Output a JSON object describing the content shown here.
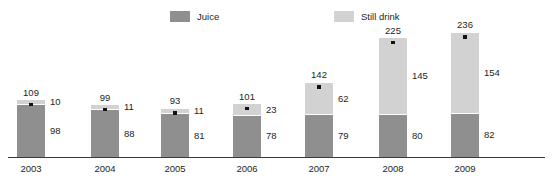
{
  "chart_data": {
    "type": "bar",
    "subtype": "stacked-bar",
    "title": "",
    "subtitle": "",
    "xlabel": "",
    "ylabel": "",
    "grid": false,
    "legend_position": "top-center",
    "ylim": [
      0,
      236
    ],
    "categories": [
      "2003",
      "2004",
      "2005",
      "2006",
      "2007",
      "2008",
      "2009"
    ],
    "series": [
      {
        "name": "Juice",
        "color": "#8f8f8f",
        "values": [
          98,
          88,
          81,
          78,
          79,
          80,
          82
        ]
      },
      {
        "name": "Still drink",
        "color": "#d2d2d2",
        "values": [
          10,
          11,
          11,
          23,
          62,
          145,
          154
        ]
      }
    ],
    "totals": [
      109,
      99,
      93,
      101,
      142,
      225,
      236
    ],
    "total_marker": "black-square"
  },
  "legend": {
    "items": [
      {
        "label": "Juice",
        "color": "#8f8f8f"
      },
      {
        "label": "Still drink",
        "color": "#d2d2d2"
      }
    ]
  },
  "colors": {
    "juice": "#8f8f8f",
    "still_drink": "#d2d2d2",
    "axis": "#3a3a3a",
    "text": "#231f20",
    "marker": "#111111",
    "background": "#ffffff"
  }
}
